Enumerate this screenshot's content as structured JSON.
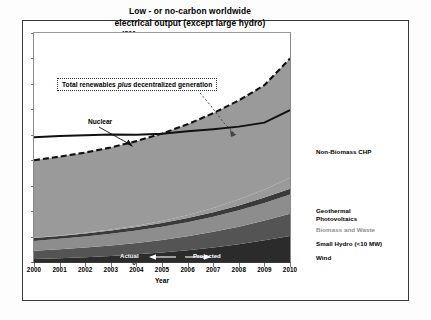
{
  "chart_data": {
    "type": "area",
    "title": "Low - or no-carbon worldwide electrical output (except large hydro)",
    "title_line1": "Low - or no-carbon worldwide",
    "title_line2": "electrical output (except large hydro)",
    "xlabel": "Year",
    "ylabel": "",
    "xlim": [
      2000,
      2010
    ],
    "ylim": [
      0,
      4500
    ],
    "yticks": [
      0,
      500,
      1000,
      1500,
      2000,
      2500,
      3000,
      3500,
      4000,
      4500
    ],
    "ytick_labels": [
      "0",
      "500",
      "1000",
      "1500",
      "2000",
      "2500",
      "3000",
      "3500",
      "4000",
      "4500"
    ],
    "x": [
      2000,
      2001,
      2002,
      2003,
      2004,
      2005,
      2006,
      2007,
      2008,
      2009,
      2010
    ],
    "xtick_labels": [
      "2000",
      "2001",
      "2002",
      "2003",
      "2004",
      "2005",
      "2006",
      "2007",
      "2008",
      "2009",
      "2010"
    ],
    "grid": false,
    "legend_position": "right",
    "series": [
      {
        "name": "Wind",
        "color": "#2b2b2b",
        "values": [
          60,
          75,
          95,
          120,
          150,
          185,
          230,
          285,
          350,
          425,
          510
        ]
      },
      {
        "name": "Small Hydro (<10 MW)",
        "color": "#545454",
        "values": [
          160,
          175,
          190,
          205,
          225,
          248,
          275,
          308,
          345,
          390,
          440
        ]
      },
      {
        "name": "Biomass and Waste",
        "color": "#8d8d8d",
        "values": [
          195,
          205,
          215,
          228,
          242,
          258,
          276,
          297,
          320,
          346,
          375
        ]
      },
      {
        "name": "Geothermal",
        "color": "#3a3a3a",
        "values": [
          55,
          58,
          62,
          66,
          70,
          76,
          82,
          89,
          97,
          106,
          115
        ]
      },
      {
        "name": "Photovoltaics",
        "color": "#9a9a9a",
        "values": [
          5,
          8,
          12,
          18,
          27,
          40,
          58,
          82,
          115,
          160,
          215
        ]
      },
      {
        "name": "Non-Biomass CHP",
        "color": "#9a9a9a",
        "values": [
          1525,
          1549,
          1576,
          1613,
          1661,
          1718,
          1784,
          1864,
          1948,
          2048,
          2345
        ]
      }
    ],
    "lines": [
      {
        "name": "Nuclear",
        "style": "solid",
        "color": "#111111",
        "values": [
          2450,
          2475,
          2490,
          2505,
          2500,
          2520,
          2570,
          2610,
          2660,
          2740,
          2985
        ]
      },
      {
        "name": "Total renewables plus decentralized generation",
        "style": "dashed",
        "color": "#111111",
        "values": [
          2000,
          2070,
          2150,
          2250,
          2375,
          2525,
          2705,
          2925,
          3175,
          3475,
          4000
        ]
      }
    ],
    "annotations": [
      {
        "name": "total-renewables-box",
        "text_before": "Total renewables ",
        "text_italic": "plus",
        "text_after": " decentralized generation"
      },
      {
        "name": "nuclear-label",
        "text": "Nuclear"
      },
      {
        "name": "actual-label",
        "text": "Actual"
      },
      {
        "name": "projected-label",
        "text": "Projected"
      }
    ]
  },
  "legend": {
    "items": [
      {
        "label": "Non-Biomass CHP",
        "dim": false,
        "top": 148
      },
      {
        "label": "Geothermal",
        "dim": false,
        "top": 207
      },
      {
        "label": "Photovoltaics",
        "dim": false,
        "top": 215
      },
      {
        "label": "Biomass and Waste",
        "dim": true,
        "top": 226
      },
      {
        "label": "Small Hydro (<10 MW)",
        "dim": false,
        "top": 240
      },
      {
        "label": "Wind",
        "dim": false,
        "top": 254
      }
    ]
  }
}
